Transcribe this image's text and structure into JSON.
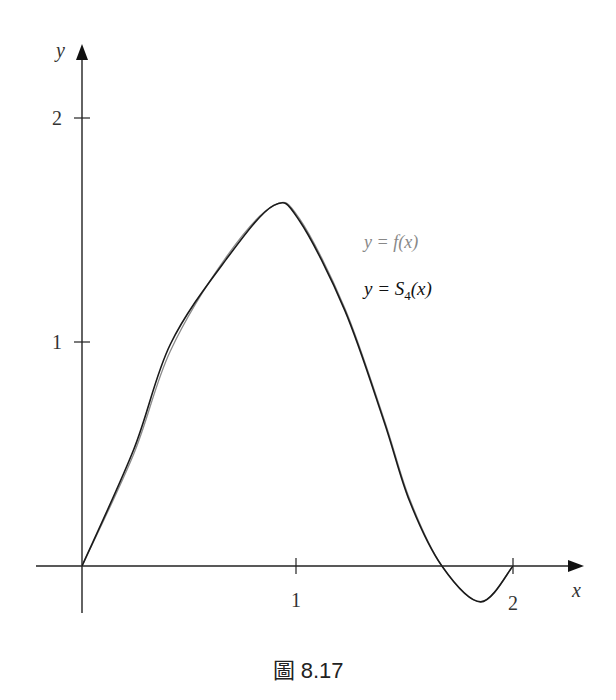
{
  "caption": "圖 8.17",
  "colors": {
    "f_curve": "#8a8a8a",
    "s4_curve": "#1a1a1a",
    "axis": "#222222"
  },
  "chart_data": {
    "type": "line",
    "title": "",
    "xlabel": "x",
    "ylabel": "y",
    "xlim": [
      -0.2,
      2.3
    ],
    "ylim": [
      -0.2,
      2.1
    ],
    "x_ticks": [
      1,
      2
    ],
    "y_ticks": [
      1,
      2
    ],
    "grid": false,
    "legend_position": "inline-right-of-peak",
    "series": [
      {
        "name": "y = f(x)",
        "color": "#8a8a8a",
        "x": [
          0,
          0.24,
          0.41,
          0.67,
          0.89,
          1.01,
          1.22,
          1.4,
          1.52,
          1.67,
          1.85,
          2.0
        ],
        "y": [
          0,
          0.5,
          0.96,
          1.38,
          1.61,
          1.55,
          1.15,
          0.66,
          0.3,
          0,
          -0.16,
          0
        ]
      },
      {
        "name": "y = S4(x)",
        "color": "#1a1a1a",
        "x": [
          0,
          0.24,
          0.41,
          0.67,
          0.89,
          1.01,
          1.22,
          1.4,
          1.52,
          1.67,
          1.85,
          2.0
        ],
        "y": [
          0,
          0.52,
          0.99,
          1.37,
          1.61,
          1.54,
          1.14,
          0.65,
          0.29,
          0,
          -0.16,
          0
        ]
      }
    ],
    "annotations": [
      {
        "text": "y = f(x)",
        "x": 1.35,
        "y": 1.45
      },
      {
        "text": "y = S4(x)",
        "x": 1.35,
        "y": 1.22
      }
    ]
  },
  "labels": {
    "x_axis": "x",
    "y_axis": "y",
    "x_tick_1": "1",
    "x_tick_2": "2",
    "y_tick_1": "1",
    "y_tick_2": "2",
    "legend_f_prefix": "y = ",
    "legend_f_func": "f(x)",
    "legend_s_prefix": "y = ",
    "legend_s_S": "S",
    "legend_s_sub": "4",
    "legend_s_arg": "(x)"
  }
}
